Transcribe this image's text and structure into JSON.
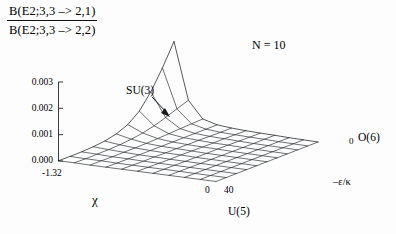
{
  "figure": {
    "kind": "3d-surface-mesh",
    "title_numerator": "B(E2;3,3 –> 2,1)",
    "title_denominator": "B(E2;3,3 –> 2,2)",
    "annotations": {
      "particle_number": "N = 10",
      "su3_corner": "SU(3)",
      "o6_corner": "O(6)",
      "u5_corner": "U(5)"
    },
    "axes": {
      "z_ticks": [
        "0.003",
        "0.002",
        "0.001",
        "0.000"
      ],
      "x_axis_label": "χ",
      "x_tick_min": "-1.32",
      "x_tick_zero": "0",
      "y_axis_label": "–ε/κ",
      "y_tick_40": "40",
      "y_tick_0": "0"
    }
  },
  "chart_data": {
    "type": "surface",
    "subtitle": "N = 10",
    "xlabel": "χ",
    "ylabel": "–ε/κ",
    "zlabel": "",
    "xlim": [
      -1.32,
      0
    ],
    "ylim": [
      0,
      40
    ],
    "zlim": [
      0.0,
      0.003
    ],
    "z_ticks": [
      0.0,
      0.001,
      0.002,
      0.003
    ],
    "x_ticks": [
      -1.32,
      0
    ],
    "y_ticks": [
      0,
      40
    ],
    "grid": false,
    "legend": false,
    "corner_labels": [
      {
        "name": "SU(3)",
        "x": -1.32,
        "y": 40
      },
      {
        "name": "O(6)",
        "x": 0.0,
        "y": 40
      },
      {
        "name": "U(5)",
        "x": 0.0,
        "y": 0
      }
    ],
    "nx": 10,
    "ny": 10,
    "z_values": [
      [
        0.003,
        0.00085,
        0.00022,
        8e-05,
        4e-05,
        2e-05,
        1e-05,
        1e-05,
        0.0,
        0.0,
        0.0
      ],
      [
        0.00215,
        0.00068,
        0.00019,
        7e-05,
        3e-05,
        2e-05,
        1e-05,
        1e-05,
        0.0,
        0.0,
        0.0
      ],
      [
        0.0014,
        0.0005,
        0.00016,
        6e-05,
        3e-05,
        2e-05,
        1e-05,
        0.0,
        0.0,
        0.0,
        0.0
      ],
      [
        0.00082,
        0.00034,
        0.00012,
        5e-05,
        3e-05,
        1e-05,
        1e-05,
        0.0,
        0.0,
        0.0,
        0.0
      ],
      [
        0.00046,
        0.00022,
        9e-05,
        4e-05,
        2e-05,
        1e-05,
        1e-05,
        0.0,
        0.0,
        0.0,
        0.0
      ],
      [
        0.00026,
        0.00014,
        6e-05,
        3e-05,
        2e-05,
        1e-05,
        0.0,
        0.0,
        0.0,
        0.0,
        0.0
      ],
      [
        0.00014,
        8e-05,
        4e-05,
        2e-05,
        1e-05,
        1e-05,
        0.0,
        0.0,
        0.0,
        0.0,
        0.0
      ],
      [
        8e-05,
        5e-05,
        3e-05,
        1e-05,
        1e-05,
        0.0,
        0.0,
        0.0,
        0.0,
        0.0,
        0.0
      ],
      [
        4e-05,
        3e-05,
        1e-05,
        1e-05,
        0.0,
        0.0,
        0.0,
        0.0,
        0.0,
        0.0,
        0.0
      ],
      [
        2e-05,
        1e-05,
        1e-05,
        0.0,
        0.0,
        0.0,
        0.0,
        0.0,
        0.0,
        0.0,
        0.0
      ],
      [
        1e-05,
        1e-05,
        0.0,
        0.0,
        0.0,
        0.0,
        0.0,
        0.0,
        0.0,
        0.0,
        0.0
      ]
    ]
  }
}
